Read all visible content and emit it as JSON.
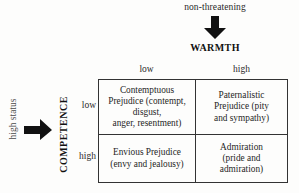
{
  "diagram": {
    "horizontal_axis": {
      "pole_label": "non-threatening",
      "axis_title": "WARMTH",
      "arrow_icon": "down-arrow-icon",
      "levels": [
        "low",
        "high"
      ]
    },
    "vertical_axis": {
      "pole_label": "high status",
      "axis_title": "COMPETENCE",
      "arrow_icon": "right-arrow-icon",
      "levels": [
        "low",
        "high"
      ]
    },
    "cells": [
      {
        "id": "low-competence-low-warmth",
        "lines": [
          "Contemptuous",
          "Prejudice (contempt,",
          "disgust,",
          "anger, resentment)"
        ]
      },
      {
        "id": "low-competence-high-warmth",
        "lines": [
          "Paternalistic",
          "Prejudice (pity",
          "and sympathy)"
        ]
      },
      {
        "id": "high-competence-low-warmth",
        "lines": [
          "Envious Prejudice",
          "(envy and jealousy)"
        ]
      },
      {
        "id": "high-competence-high-warmth",
        "lines": [
          "Admiration",
          "(pride and",
          "admiration)"
        ]
      }
    ],
    "colors": {
      "line": "#333333",
      "text": "#1a1a1a",
      "muted_text": "#4a4a4a",
      "background": "#fdfdfc"
    }
  }
}
